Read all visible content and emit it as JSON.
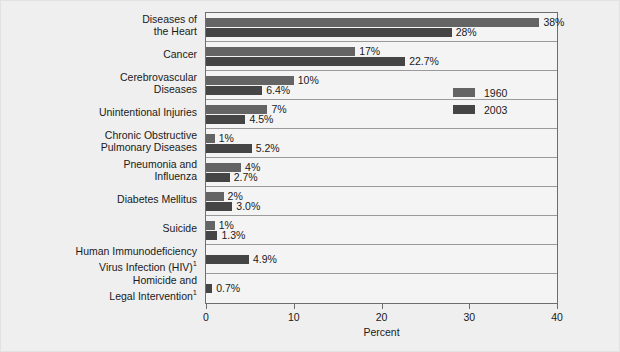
{
  "chart_data": {
    "type": "bar",
    "orientation": "horizontal",
    "title": "",
    "xlabel": "Percent",
    "ylabel": "",
    "xlim": [
      0,
      40
    ],
    "xticks": [
      0,
      10,
      20,
      30,
      40
    ],
    "grid": false,
    "legend_position": "inside-right-upper",
    "categories": [
      "Diseases of the Heart",
      "Cancer",
      "Cerebrovascular Diseases",
      "Unintentional Injuries",
      "Chronic Obstructive Pulmonary Diseases",
      "Pneumonia and Influenza",
      "Diabetes Mellitus",
      "Suicide",
      "Human Immunodeficiency Virus Infection (HIV)¹",
      "Homicide and Legal Intervention¹"
    ],
    "series": [
      {
        "name": "1960",
        "color": "#646464",
        "values": [
          38,
          17,
          10,
          7,
          1,
          4,
          2,
          1,
          null,
          null
        ],
        "labels": [
          "38%",
          "17%",
          "10%",
          "7%",
          "1%",
          "4%",
          "2%",
          "1%",
          "",
          ""
        ]
      },
      {
        "name": "2003",
        "color": "#454545",
        "values": [
          28,
          22.7,
          6.4,
          4.5,
          5.2,
          2.7,
          3.0,
          1.3,
          4.9,
          0.7
        ],
        "labels": [
          "28%",
          "22.7%",
          "6.4%",
          "4.5%",
          "5.2%",
          "2.7%",
          "3.0%",
          "1.3%",
          "4.9%",
          "0.7%"
        ]
      }
    ]
  },
  "category_lines": [
    [
      "Diseases of",
      "the Heart"
    ],
    [
      "Cancer"
    ],
    [
      "Cerebrovascular",
      "Diseases"
    ],
    [
      "Unintentional Injuries"
    ],
    [
      "Chronic Obstructive",
      "Pulmonary Diseases"
    ],
    [
      "Pneumonia and",
      "Influenza"
    ],
    [
      "Diabetes Mellitus"
    ],
    [
      "Suicide"
    ],
    [
      "Human Immunodeficiency",
      "Virus Infection (HIV)¹"
    ],
    [
      "Homicide and",
      "Legal Intervention¹"
    ]
  ],
  "axis": {
    "tick_labels": [
      "0",
      "10",
      "20",
      "30",
      "40"
    ],
    "title": "Percent"
  },
  "legend": {
    "items": [
      {
        "label": "1960",
        "color": "#646464"
      },
      {
        "label": "2003",
        "color": "#454545"
      }
    ]
  },
  "colors": {
    "background": "#efefef",
    "plot_background": "#f4f4f4",
    "frame": "#6e6e6e",
    "rowline": "#9a9a9a",
    "series_1960": "#646464",
    "series_2003": "#454545",
    "text": "#1a1a1a"
  }
}
